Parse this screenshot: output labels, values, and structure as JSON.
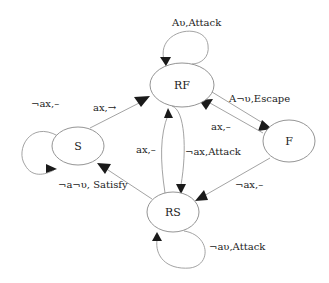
{
  "nodes": [
    {
      "id": "S",
      "label": "S"
    },
    {
      "id": "RF",
      "label": "RF"
    },
    {
      "id": "F",
      "label": "F"
    },
    {
      "id": "RS",
      "label": "RS"
    }
  ],
  "edges": [
    {
      "from": "RF",
      "to": "RF",
      "label": "Aυ,Attack"
    },
    {
      "from": "S",
      "to": "S",
      "label": "¬ax,–"
    },
    {
      "from": "S",
      "to": "RF",
      "label": "ax,→"
    },
    {
      "from": "RF",
      "to": "F",
      "label": "A¬υ,Escape"
    },
    {
      "from": "F",
      "to": "RF",
      "label": "ax,–"
    },
    {
      "from": "RS",
      "to": "RF",
      "label": "ax,–"
    },
    {
      "from": "RF",
      "to": "RS",
      "label": "¬ax,Attack"
    },
    {
      "from": "F",
      "to": "RS",
      "label": "¬ax,–"
    },
    {
      "from": "RS",
      "to": "S",
      "label": "¬a¬υ, Satisfy"
    },
    {
      "from": "RS",
      "to": "RS",
      "label": "¬aυ,Attack"
    }
  ]
}
